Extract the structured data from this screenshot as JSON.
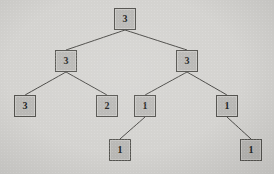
{
  "diagram": {
    "type": "binary-tree",
    "background_color": "#d4d3d0",
    "node_fill_color": "#b9b8b5",
    "node_border_color": "#555450",
    "edge_color": "#4a4946",
    "text_color": "#201f1d",
    "node_width": 22,
    "node_height": 22,
    "nodes": [
      {
        "id": "n0",
        "label": "3",
        "x": 114,
        "y": 8,
        "level": 0,
        "name": "tree-node-root"
      },
      {
        "id": "n1",
        "label": "3",
        "x": 55,
        "y": 50,
        "level": 1,
        "name": "tree-node-left"
      },
      {
        "id": "n2",
        "label": "3",
        "x": 176,
        "y": 50,
        "level": 1,
        "name": "tree-node-right"
      },
      {
        "id": "n3",
        "label": "3",
        "x": 14,
        "y": 95,
        "level": 2,
        "name": "tree-node-left-left"
      },
      {
        "id": "n4",
        "label": "2",
        "x": 96,
        "y": 95,
        "level": 2,
        "name": "tree-node-left-right"
      },
      {
        "id": "n5",
        "label": "1",
        "x": 134,
        "y": 95,
        "level": 2,
        "name": "tree-node-right-left"
      },
      {
        "id": "n6",
        "label": "1",
        "x": 216,
        "y": 95,
        "level": 2,
        "name": "tree-node-right-right"
      },
      {
        "id": "n7",
        "label": "1",
        "x": 109,
        "y": 139,
        "level": 3,
        "name": "tree-node-right-left-left"
      },
      {
        "id": "n8",
        "label": "1",
        "x": 240,
        "y": 139,
        "level": 3,
        "name": "tree-node-right-right-right"
      }
    ],
    "edges": [
      {
        "from": "n0",
        "to": "n1",
        "name": "edge-root-to-left"
      },
      {
        "from": "n0",
        "to": "n2",
        "name": "edge-root-to-right"
      },
      {
        "from": "n1",
        "to": "n3",
        "name": "edge-left-to-left-left"
      },
      {
        "from": "n1",
        "to": "n4",
        "name": "edge-left-to-left-right"
      },
      {
        "from": "n2",
        "to": "n5",
        "name": "edge-right-to-right-left"
      },
      {
        "from": "n2",
        "to": "n6",
        "name": "edge-right-to-right-right"
      },
      {
        "from": "n5",
        "to": "n7",
        "name": "edge-right-left-to-child"
      },
      {
        "from": "n6",
        "to": "n8",
        "name": "edge-right-right-to-child"
      }
    ]
  }
}
